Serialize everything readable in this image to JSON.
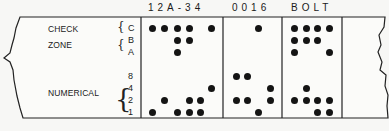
{
  "headers": [
    {
      "text": "12A-34",
      "x": 148
    },
    {
      "text": "0016",
      "x": 232
    },
    {
      "text": "BOLT",
      "x": 291
    }
  ],
  "groups": {
    "check": "CHECK",
    "zone": "ZONE",
    "numerical": "NUMERICAL"
  },
  "rows": [
    {
      "label": "C",
      "y": 28
    },
    {
      "label": "B",
      "y": 40
    },
    {
      "label": "A",
      "y": 52
    },
    {
      "label": "8",
      "y": 76
    },
    {
      "label": "4",
      "y": 88
    },
    {
      "label": "2",
      "y": 100
    },
    {
      "label": "1",
      "y": 112
    }
  ],
  "characters": [
    {
      "char": "1",
      "x": 152,
      "bits": [
        "C",
        "1"
      ]
    },
    {
      "char": "2",
      "x": 164,
      "bits": [
        "C",
        "2"
      ]
    },
    {
      "char": "A",
      "x": 177,
      "bits": [
        "C",
        "B",
        "A",
        "1"
      ]
    },
    {
      "char": "-",
      "x": 189,
      "bits": [
        "C",
        "B",
        "2",
        "1"
      ]
    },
    {
      "char": "3",
      "x": 200,
      "bits": [
        "2",
        "1"
      ]
    },
    {
      "char": "4",
      "x": 211,
      "bits": [
        "C",
        "4"
      ]
    },
    {
      "char": "0",
      "x": 236,
      "bits": [
        "8",
        "2"
      ]
    },
    {
      "char": "0",
      "x": 247,
      "bits": [
        "8",
        "2"
      ]
    },
    {
      "char": "1",
      "x": 258,
      "bits": [
        "C",
        "1"
      ]
    },
    {
      "char": "6",
      "x": 270,
      "bits": [
        "4",
        "2"
      ]
    },
    {
      "char": "B",
      "x": 294,
      "bits": [
        "C",
        "B",
        "A",
        "2"
      ]
    },
    {
      "char": "O",
      "x": 306,
      "bits": [
        "C",
        "B",
        "4",
        "2"
      ]
    },
    {
      "char": "L",
      "x": 317,
      "bits": [
        "C",
        "B",
        "2",
        "1"
      ]
    },
    {
      "char": "T",
      "x": 329,
      "bits": [
        "C",
        "A",
        "2",
        "1"
      ]
    }
  ],
  "dividers_x": [
    141,
    223,
    282,
    342
  ]
}
